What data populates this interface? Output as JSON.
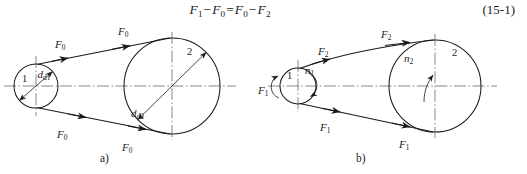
{
  "equation": {
    "number": "(15-1)",
    "terms": {
      "f1": "F",
      "f1_sub": "1",
      "f0a": "F",
      "f0a_sub": "0",
      "f0b": "F",
      "f0b_sub": "0",
      "f2": "F",
      "f2_sub": "2"
    },
    "minus": "−",
    "equals": "="
  },
  "figure_a": {
    "caption": "a)",
    "pulley_1_label": "1",
    "pulley_2_label": "2",
    "diameter_1": "d",
    "diameter_1_sub": "d1",
    "diameter_2": "d",
    "diameter_2_sub": "d2",
    "force_labels": [
      {
        "symbol": "F",
        "sub": "0",
        "position": "upper-left"
      },
      {
        "symbol": "F",
        "sub": "0",
        "position": "upper-right"
      },
      {
        "symbol": "F",
        "sub": "0",
        "position": "lower-left"
      },
      {
        "symbol": "F",
        "sub": "0",
        "position": "lower-right"
      }
    ]
  },
  "figure_b": {
    "caption": "b)",
    "pulley_1_label": "1",
    "pulley_2_label": "2",
    "speed_1": "n",
    "speed_1_sub": "1",
    "speed_2": "n",
    "speed_2_sub": "2",
    "force_labels": [
      {
        "symbol": "F",
        "sub": "1",
        "position": "far-left"
      },
      {
        "symbol": "F",
        "sub": "2",
        "position": "upper-left"
      },
      {
        "symbol": "F",
        "sub": "2",
        "position": "upper-right"
      },
      {
        "symbol": "F",
        "sub": "1",
        "position": "lower-left"
      },
      {
        "symbol": "F",
        "sub": "1",
        "position": "lower-right"
      }
    ]
  },
  "colors": {
    "ink": "#1a1a1a",
    "centerline": "#6b6b6b",
    "background": "#ffffff"
  }
}
